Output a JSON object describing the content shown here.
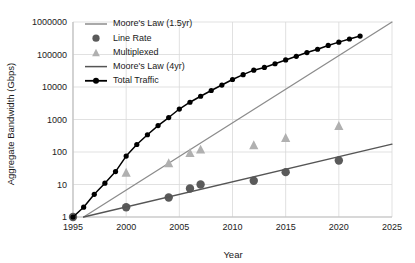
{
  "chart_data": {
    "type": "line",
    "title": "",
    "xlabel": "Year",
    "ylabel": "Aggregate Bandwidth (Gbps)",
    "xlim": [
      1995,
      2025
    ],
    "ylim": [
      1,
      1000000
    ],
    "yscale": "log",
    "grid": true,
    "legend_position": "top-left",
    "xticks": [
      "1995",
      "2000",
      "2005",
      "2010",
      "2015",
      "2020",
      "2025"
    ],
    "xtick_values": [
      1995,
      2000,
      2005,
      2010,
      2015,
      2020,
      2025
    ],
    "yticks": [
      "1",
      "10",
      "100",
      "1000",
      "10000",
      "100000",
      "1000000"
    ],
    "ytick_values": [
      1,
      10,
      100,
      1000,
      10000,
      100000,
      1000000
    ],
    "colors": {
      "moores_law_15yr": "#8c8c8c",
      "line_rate": "#5a5a5a",
      "multiplexed": "#b0b0b0",
      "moores_law_4yr": "#555555",
      "total_traffic": "#000000",
      "grid": "#d9d9d9",
      "axis": "#bfbfbf",
      "background": "#ffffff"
    },
    "series": [
      {
        "name": "Moore's Law (1.5yr)",
        "marker": "line",
        "color": "#8c8c8c",
        "x": [
          1996,
          2025
        ],
        "values": [
          1,
          1000000
        ]
      },
      {
        "name": "Line Rate",
        "marker": "circle",
        "color": "#5a5a5a",
        "x": [
          1995,
          2000,
          2004,
          2006,
          2007,
          2012,
          2015,
          2020
        ],
        "values": [
          1,
          2,
          4,
          7.5,
          10,
          13,
          24,
          55
        ]
      },
      {
        "name": "Multiplexed",
        "marker": "triangle",
        "color": "#b0b0b0",
        "x": [
          2000,
          2004,
          2006,
          2007,
          2012,
          2015,
          2020
        ],
        "values": [
          23,
          45,
          92,
          118,
          160,
          270,
          630
        ]
      },
      {
        "name": "Moore's Law (4yr)",
        "marker": "line",
        "color": "#555555",
        "x": [
          1996,
          2025
        ],
        "values": [
          1,
          175
        ]
      },
      {
        "name": "Total Traffic",
        "marker": "line-circle",
        "color": "#000000",
        "x": [
          1995,
          1996,
          1997,
          1998,
          1999,
          2000,
          2001,
          2002,
          2003,
          2004,
          2005,
          2006,
          2007,
          2008,
          2009,
          2010,
          2011,
          2012,
          2013,
          2014,
          2015,
          2016,
          2017,
          2018,
          2019,
          2020,
          2021,
          2022
        ],
        "values": [
          1,
          2,
          5,
          11,
          25,
          75,
          170,
          340,
          650,
          1150,
          2100,
          3400,
          5200,
          7800,
          11500,
          17000,
          24000,
          33000,
          40000,
          52000,
          68000,
          88000,
          115000,
          145000,
          190000,
          240000,
          300000,
          370000
        ]
      }
    ],
    "legend": [
      {
        "label": "Moore's Law (1.5yr)",
        "marker": "line",
        "color": "#8c8c8c"
      },
      {
        "label": "Line Rate",
        "marker": "circle",
        "color": "#5a5a5a"
      },
      {
        "label": "Multiplexed",
        "marker": "triangle",
        "color": "#b0b0b0"
      },
      {
        "label": "Moore's Law (4yr)",
        "marker": "line",
        "color": "#555555"
      },
      {
        "label": "Total Traffic",
        "marker": "line-circle",
        "color": "#000000"
      }
    ]
  }
}
